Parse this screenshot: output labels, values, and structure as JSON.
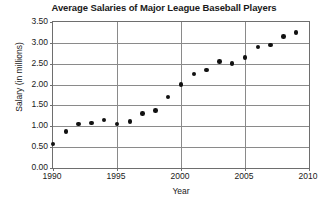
{
  "chart_data": {
    "type": "scatter",
    "title": "Average Salaries of Major League Baseball Players",
    "xlabel": "Year",
    "ylabel": "Salary (in millions)",
    "xlim": [
      1990,
      2010
    ],
    "ylim": [
      0.0,
      3.5
    ],
    "grid": true,
    "legend": null,
    "xticks": [
      "1990",
      "1995",
      "2000",
      "2005",
      "2010"
    ],
    "xtick_values": [
      1990,
      1995,
      2000,
      2005,
      2010
    ],
    "yticks": [
      "0.00",
      "0.50",
      "1.00",
      "1.50",
      "2.00",
      "2.50",
      "3.00",
      "3.50"
    ],
    "ytick_values": [
      0.0,
      0.5,
      1.0,
      1.5,
      2.0,
      2.5,
      3.0,
      3.5
    ],
    "x": [
      1990,
      1991,
      1992,
      1993,
      1994,
      1995,
      1996,
      1997,
      1998,
      1999,
      2000,
      2001,
      2002,
      2003,
      2004,
      2005,
      2006,
      2007,
      2008,
      2009
    ],
    "values": [
      0.58,
      0.88,
      1.05,
      1.08,
      1.15,
      1.05,
      1.12,
      1.3,
      1.38,
      1.7,
      2.0,
      2.25,
      2.35,
      2.55,
      2.5,
      2.65,
      2.9,
      2.95,
      3.15,
      3.25
    ],
    "marker_color": "#111111",
    "grid_color": "#8a8a8a",
    "axis_color": "#6e6e6e",
    "background_color": "#ffffff"
  }
}
